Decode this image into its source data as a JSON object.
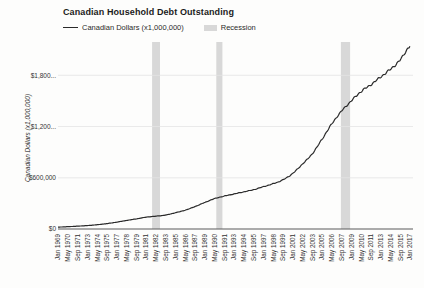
{
  "chart": {
    "legend": {
      "series_label": "Canadian Dollars (x1,000,000)",
      "recession_label": "Recession"
    }
  },
  "chart_data": {
    "type": "line",
    "title": "Canadian Household Debt Outstanding",
    "ylabel": "Canadian Dollars (x1,000,000)",
    "x_tick_labels": [
      "Jan 1969",
      "May 1970",
      "Sep 1971",
      "Jan 1973",
      "May 1974",
      "Sep 1975",
      "Jan 1977",
      "May 1978",
      "Sep 1979",
      "Jan 1981",
      "May 1982",
      "Sep 1983",
      "Jan 1985",
      "May 1986",
      "Sep 1987",
      "Jan 1989",
      "May 1990",
      "Sep 1991",
      "Jan 1993",
      "May 1994",
      "Sep 1995",
      "Jan 1997",
      "May 1998",
      "Sep 1999",
      "Jan 2001",
      "May 2002",
      "Sep 2003",
      "Jan 2005",
      "May 2006",
      "Sep 2007",
      "Jan 2009",
      "May 2010",
      "Sep 2011",
      "Jan 2013",
      "May 2014",
      "Sep 2015",
      "Jan 2017"
    ],
    "x_tick_interval_months": 16,
    "x_total_months": 581,
    "series": [
      {
        "name": "Canadian Dollars (x1,000,000)",
        "color": "#2a2a2a",
        "values": [
          22000,
          27000,
          33000,
          40000,
          50000,
          63000,
          80000,
          100000,
          118000,
          138000,
          150000,
          163000,
          190000,
          220000,
          262000,
          310000,
          355000,
          385000,
          410000,
          435000,
          460000,
          495000,
          530000,
          575000,
          650000,
          760000,
          880000,
          1050000,
          1230000,
          1380000,
          1500000,
          1610000,
          1690000,
          1780000,
          1870000,
          1980000,
          2140000
        ]
      }
    ],
    "y_ticks": [
      {
        "label": "$0",
        "value": 0
      },
      {
        "label": "$600,000",
        "value": 600000
      },
      {
        "label": "$1,200...",
        "value": 1200000
      },
      {
        "label": "$1,800...",
        "value": 1800000
      }
    ],
    "ylim": [
      0,
      2190000
    ],
    "grid": true,
    "legend_position": "top",
    "recessions": [
      {
        "start_month": 154,
        "end_month": 167
      },
      {
        "start_month": 259,
        "end_month": 269
      },
      {
        "start_month": 463,
        "end_month": 478
      }
    ],
    "recession_color": "#d8d8d8",
    "grid_color": "#e4e4e4",
    "axis_color": "#5a5a5a",
    "tick_text_color": "#333333"
  }
}
